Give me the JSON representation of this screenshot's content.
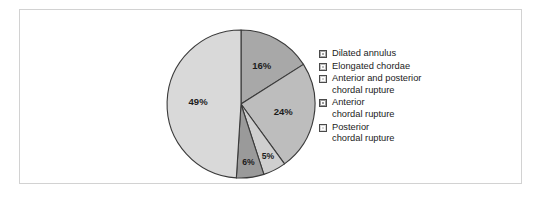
{
  "chart_data": {
    "type": "pie",
    "title": "",
    "subtitle": "",
    "xlabel": "",
    "ylabel": "",
    "grid": false,
    "legend_position": "right",
    "start_angle_deg": 0,
    "direction": "clockwise",
    "categories": [
      "Dilated annulus",
      "Elongated chordae",
      "Anterior and posterior chordal rupture",
      "Anterior chordal rupture",
      "Posterior chordal rupture"
    ],
    "values": [
      16,
      24,
      5,
      6,
      49
    ],
    "data_labels": [
      "16%",
      "24%",
      "5%",
      "6%",
      "49%"
    ],
    "colors": [
      "#a8a8a8",
      "#bdbdbd",
      "#cfcfcf",
      "#9a9a9a",
      "#d9d9d9"
    ],
    "slice_outline_color": "#3a3a3a"
  },
  "figure": {
    "frame_border_color": "#d2d2d2",
    "background_color": "#ffffff"
  },
  "slices": [
    {
      "key": "dilated-annulus",
      "label": "16%",
      "value": 16,
      "color": "#a8a8a8"
    },
    {
      "key": "elongated-chordae",
      "label": "24%",
      "value": 24,
      "color": "#bdbdbd"
    },
    {
      "key": "anterior-and-posterior",
      "label": "5%",
      "value": 5,
      "color": "#cfcfcf"
    },
    {
      "key": "anterior",
      "label": "6%",
      "value": 6,
      "color": "#9a9a9a"
    },
    {
      "key": "posterior",
      "label": "49%",
      "value": 49,
      "color": "#d9d9d9"
    }
  ],
  "legend": {
    "items": [
      {
        "line1": "Dilated annulus",
        "line2": "",
        "color": "#a8a8a8"
      },
      {
        "line1": "Elongated chordae",
        "line2": "",
        "color": "#bdbdbd"
      },
      {
        "line1": "Anterior and posterior",
        "line2": "chordal rupture",
        "color": "#cfcfcf"
      },
      {
        "line1": "Anterior",
        "line2": "chordal rupture",
        "color": "#9a9a9a"
      },
      {
        "line1": "Posterior",
        "line2": "chordal rupture",
        "color": "#d9d9d9"
      }
    ]
  }
}
